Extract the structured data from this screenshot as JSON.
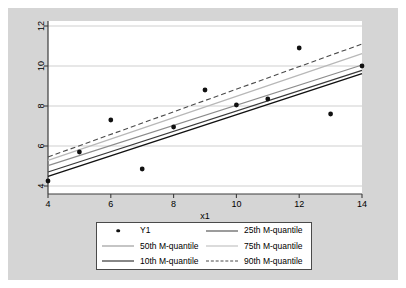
{
  "figure": {
    "background_color": "#d5d5d5",
    "plot_background_color": "#ffffff",
    "border_color": "#4a4a4a"
  },
  "legend": {
    "items": [
      {
        "label": "Y1",
        "key": "marker-dot",
        "color": "#111111",
        "dash": "none"
      },
      {
        "label": "25th M-quantile",
        "key": "line",
        "color": "#3a3a3a",
        "dash": "none"
      },
      {
        "label": "50th M-quantile",
        "key": "line",
        "color": "#8c8c8c",
        "dash": "none"
      },
      {
        "label": "75th M-quantile",
        "key": "line",
        "color": "#b8b8b8",
        "dash": "none"
      },
      {
        "label": "10th M-quantile",
        "key": "line",
        "color": "#111111",
        "dash": "none"
      },
      {
        "label": "90th M-quantile",
        "key": "line",
        "color": "#4a4a4a",
        "dash": "dashed"
      }
    ]
  },
  "chart_data": {
    "type": "scatter",
    "title": "",
    "xlabel": "x1",
    "ylabel": "",
    "xlim": [
      4,
      14
    ],
    "ylim": [
      3.6,
      12.25
    ],
    "xticks": [
      4,
      6,
      8,
      10,
      12,
      14
    ],
    "yticks": [
      4,
      6,
      8,
      10,
      12
    ],
    "xtick_labels": [
      "4",
      "6",
      "8",
      "10",
      "12",
      "14"
    ],
    "ytick_labels": [
      "4",
      "6",
      "8",
      "10",
      "12"
    ],
    "grid": "horizontal",
    "grid_color": "#c9c9c9",
    "legend_position": "below-axes",
    "scatter": {
      "name": "Y1",
      "color": "#111111",
      "x": [
        4,
        5,
        6,
        7,
        8,
        9,
        10,
        11,
        12,
        13,
        14
      ],
      "y": [
        4.25,
        5.7,
        7.3,
        4.85,
        6.95,
        8.8,
        8.05,
        8.35,
        10.9,
        7.6,
        10.0
      ]
    },
    "series": [
      {
        "name": "10th M-quantile",
        "color": "#111111",
        "dash": "none",
        "width": 1.5,
        "x": [
          4,
          14
        ],
        "values": [
          4.48,
          9.62
        ]
      },
      {
        "name": "25th M-quantile",
        "color": "#3a3a3a",
        "dash": "none",
        "width": 1.3,
        "x": [
          4,
          14
        ],
        "values": [
          4.7,
          9.78
        ]
      },
      {
        "name": "50th M-quantile",
        "color": "#8c8c8c",
        "dash": "none",
        "width": 1.2,
        "x": [
          4,
          14
        ],
        "values": [
          5.02,
          10.05
        ]
      },
      {
        "name": "75th M-quantile",
        "color": "#b8b8b8",
        "dash": "none",
        "width": 1.2,
        "x": [
          4,
          14
        ],
        "values": [
          5.28,
          10.62
        ]
      },
      {
        "name": "90th M-quantile",
        "color": "#4a4a4a",
        "dash": "dashed",
        "width": 1.1,
        "x": [
          4,
          14
        ],
        "values": [
          5.45,
          11.1
        ]
      }
    ]
  }
}
